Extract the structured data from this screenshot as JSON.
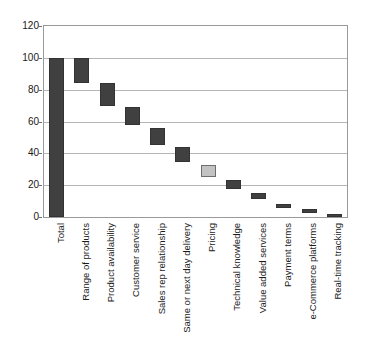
{
  "chart_data": {
    "type": "bar",
    "chart_subtype": "waterfall",
    "title": "",
    "xlabel": "",
    "ylabel": "",
    "ylim": [
      0,
      120
    ],
    "ytick_step": 20,
    "yticks": [
      "0",
      "20",
      "40",
      "60",
      "80",
      "100",
      "120"
    ],
    "grid": true,
    "legend": false,
    "categories": [
      "Total",
      "Range of products",
      "Product availability",
      "Customer service",
      "Sales rep relationship",
      "Same or next day delivery",
      "Pricing",
      "Technical knowledge",
      "Value added services",
      "Payment terms",
      "e-Commerce platforms",
      "Real-time tracking"
    ],
    "values": [
      100,
      16,
      14,
      11,
      10,
      9,
      8,
      6,
      4,
      3,
      2,
      1.5
    ],
    "bar_spans": [
      {
        "category": "Total",
        "base": 0,
        "top": 100,
        "value": 100,
        "color": "#404040",
        "highlight": false
      },
      {
        "category": "Range of products",
        "base": 84,
        "top": 100,
        "value": 16,
        "color": "#404040",
        "highlight": false
      },
      {
        "category": "Product availability",
        "base": 70,
        "top": 84,
        "value": 14,
        "color": "#404040",
        "highlight": false
      },
      {
        "category": "Customer service",
        "base": 57.5,
        "top": 69,
        "value": 11.5,
        "color": "#404040",
        "highlight": false
      },
      {
        "category": "Sales rep relationship",
        "base": 45,
        "top": 56,
        "value": 11,
        "color": "#404040",
        "highlight": false
      },
      {
        "category": "Same or next day delivery",
        "base": 34.5,
        "top": 44,
        "value": 9.5,
        "color": "#404040",
        "highlight": false
      },
      {
        "category": "Pricing",
        "base": 25,
        "top": 33,
        "value": 8,
        "color": "#c3c3c3",
        "highlight": true
      },
      {
        "category": "Technical knowledge",
        "base": 17.5,
        "top": 23,
        "value": 5.5,
        "color": "#404040",
        "highlight": false
      },
      {
        "category": "Value added services",
        "base": 11,
        "top": 15,
        "value": 4,
        "color": "#404040",
        "highlight": false
      },
      {
        "category": "Payment terms",
        "base": 6,
        "top": 8.5,
        "value": 2.5,
        "color": "#404040",
        "highlight": false
      },
      {
        "category": "e-Commerce platforms",
        "base": 2.5,
        "top": 5,
        "value": 2.5,
        "color": "#404040",
        "highlight": false
      },
      {
        "category": "Real-time tracking",
        "base": 0,
        "top": 2,
        "value": 2,
        "color": "#404040",
        "highlight": false
      }
    ],
    "colors": {
      "bar_default": "#404040",
      "bar_highlight": "#c3c3c3",
      "bar_highlight_border": "#6e6e6e",
      "gridline": "#b5b5b5",
      "frame": "#9a9a9a",
      "text": "#1a1a1a",
      "background": "#ffffff"
    }
  }
}
